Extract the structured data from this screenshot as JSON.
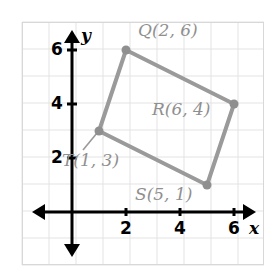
{
  "figure": {
    "type": "coordinate-plane-quadrilateral",
    "shape_name": "QRST",
    "grid": {
      "visible": true,
      "color": "#e3e3e3",
      "border_color": "#d8d8d8",
      "left_px": 22,
      "top_px": 22,
      "right_px": 264,
      "bottom_px": 265,
      "cell_px": 27
    },
    "axes": {
      "color": "#000000",
      "origin_px": {
        "x": 72,
        "y": 212
      },
      "unit_px": 27,
      "x_label": "x",
      "y_label": "y",
      "x_ticks": [
        "2",
        "4",
        "6"
      ],
      "x_tick_values": [
        2,
        4,
        6
      ],
      "y_ticks": [
        "6",
        "4",
        "2"
      ],
      "y_tick_values": [
        6,
        4,
        2
      ]
    },
    "polygon": {
      "stroke_color": "#9a9a9a",
      "stroke_width": 4,
      "vertex_dot_color": "#8f8f8f",
      "vertex_dot_radius": 4.5,
      "order": [
        "Q",
        "R",
        "S",
        "T"
      ]
    },
    "points": [
      {
        "name": "Q",
        "label": "Q(2, 6)",
        "x": 2,
        "y": 6,
        "px": {
          "x": 126,
          "y": 50
        },
        "label_px": {
          "x": 138,
          "y": 22
        }
      },
      {
        "name": "R",
        "label": "R(6, 4)",
        "x": 6,
        "y": 4,
        "px": {
          "x": 234,
          "y": 104
        },
        "label_px": {
          "x": 152,
          "y": 101
        }
      },
      {
        "name": "S",
        "label": "S(5, 1)",
        "x": 5,
        "y": 1,
        "px": {
          "x": 207,
          "y": 185
        },
        "label_px": {
          "x": 135,
          "y": 186
        }
      },
      {
        "name": "T",
        "label": "T(1, 3)",
        "x": 1,
        "y": 3,
        "px": {
          "x": 99,
          "y": 131
        },
        "label_px": {
          "x": 62,
          "y": 152
        }
      }
    ],
    "leader_line": {
      "for_point": "T",
      "color": "#9a9a9a",
      "from_px": {
        "x": 97,
        "y": 133
      },
      "to_px": {
        "x": 83,
        "y": 150
      }
    }
  }
}
